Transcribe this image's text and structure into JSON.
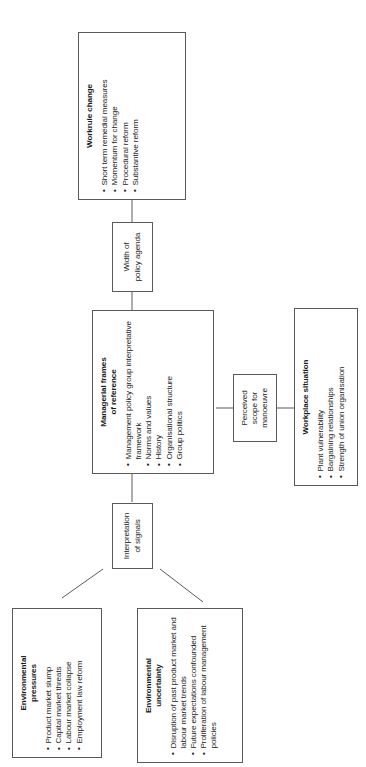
{
  "diagram": {
    "type": "flowchart",
    "orientation": "rotated-90-ccw",
    "line_color": "#5a5a5a",
    "box_border_color": "#5a5a5a",
    "background": "#ffffff",
    "text_color": "#1b1b1b",
    "nodes": [
      {
        "id": "workrule-change",
        "title": "Workrule change",
        "bullets": [
          "Short term remedial measures",
          "Momentum for change",
          "Procedural reform",
          "Substantive reform"
        ]
      },
      {
        "id": "width-of-policy-agenda",
        "title": "",
        "text": "Width of\npolicy agenda",
        "bullets": []
      },
      {
        "id": "managerial-frames-of-reference",
        "title": "Managerial frames of reference",
        "bullets": [
          "Management policy group interpretative framework",
          "Norms and values",
          "History",
          "Organisational structure",
          "Group politics"
        ]
      },
      {
        "id": "perceived-scope-for-manoeuvre",
        "title": "",
        "text": "Perceived\nscope for\nmanoeuvre",
        "bullets": []
      },
      {
        "id": "workplace-situation",
        "title": "Workplace situation",
        "bullets": [
          "Plant vulnerability",
          "Bargaining relationships",
          "Strength of union organisation"
        ]
      },
      {
        "id": "interpretation-of-signals",
        "title": "",
        "text": "Interpretation\nof signals",
        "bullets": []
      },
      {
        "id": "environmental-pressures",
        "title": "Environmental pressures",
        "bullets": [
          "Product market slump",
          "Capital market threats",
          "Labour market collapse",
          "Employment law reform"
        ]
      },
      {
        "id": "environmental-uncertainty",
        "title": "Environmental uncertainty",
        "bullets": [
          "Disruption of past product market and labour market trends",
          "Future expectations confounded",
          "Proliferation of labour management policies"
        ]
      }
    ],
    "edges": [
      {
        "from": "width-of-policy-agenda",
        "to": "workrule-change"
      },
      {
        "from": "managerial-frames-of-reference",
        "to": "width-of-policy-agenda"
      },
      {
        "from": "perceived-scope-for-manoeuvre",
        "to": "managerial-frames-of-reference"
      },
      {
        "from": "workplace-situation",
        "to": "perceived-scope-for-manoeuvre"
      },
      {
        "from": "interpretation-of-signals",
        "to": "managerial-frames-of-reference"
      },
      {
        "from": "environmental-pressures",
        "to": "interpretation-of-signals"
      },
      {
        "from": "environmental-uncertainty",
        "to": "interpretation-of-signals"
      }
    ]
  },
  "labels": {
    "workrule_change_title": "Workrule change",
    "workrule_change_b1": "Short term remedial measures",
    "workrule_change_b2": "Momentum for change",
    "workrule_change_b3": "Procedural reform",
    "workrule_change_b4": "Substantive reform",
    "width_policy_line1": "Width of",
    "width_policy_line2": "policy agenda",
    "managerial_title_line1": "Managerial frames",
    "managerial_title_line2": "of reference",
    "managerial_b1": "Management policy group interpretative framework",
    "managerial_b2": "Norms and values",
    "managerial_b3": "History",
    "managerial_b4": "Organisational structure",
    "managerial_b5": "Group politics",
    "perceived_line1": "Perceived",
    "perceived_line2": "scope for",
    "perceived_line3": "manoeuvre",
    "workplace_title": "Workplace situation",
    "workplace_b1": "Plant vulnerability",
    "workplace_b2": "Bargaining relationships",
    "workplace_b3": "Strength of union organisation",
    "interp_line1": "Interpretation",
    "interp_line2": "of signals",
    "env_pressures_title_line1": "Environmental",
    "env_pressures_title_line2": "pressures",
    "env_pressures_b1": "Product market slump",
    "env_pressures_b2": "Capital market threats",
    "env_pressures_b3": "Labour market collapse",
    "env_pressures_b4": "Employment law reform",
    "env_uncert_title_line1": "Environmental",
    "env_uncert_title_line2": "uncertainty",
    "env_uncert_b1": "Disruption of past product market and labour market trends",
    "env_uncert_b2": "Future expectations confounded",
    "env_uncert_b3": "Proliferation of labour management policies"
  }
}
